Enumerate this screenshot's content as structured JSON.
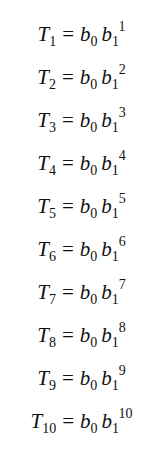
{
  "equations": [
    {
      "lhs_var": "T",
      "lhs_sub": "1",
      "op": "=",
      "a": "b",
      "a_sub": "0",
      "b": "b",
      "b_sub": "1",
      "b_sup": "1"
    },
    {
      "lhs_var": "T",
      "lhs_sub": "2",
      "op": "=",
      "a": "b",
      "a_sub": "0",
      "b": "b",
      "b_sub": "1",
      "b_sup": "2"
    },
    {
      "lhs_var": "T",
      "lhs_sub": "3",
      "op": "=",
      "a": "b",
      "a_sub": "0",
      "b": "b",
      "b_sub": "1",
      "b_sup": "3"
    },
    {
      "lhs_var": "T",
      "lhs_sub": "4",
      "op": "=",
      "a": "b",
      "a_sub": "0",
      "b": "b",
      "b_sub": "1",
      "b_sup": "4"
    },
    {
      "lhs_var": "T",
      "lhs_sub": "5",
      "op": "=",
      "a": "b",
      "a_sub": "0",
      "b": "b",
      "b_sub": "1",
      "b_sup": "5"
    },
    {
      "lhs_var": "T",
      "lhs_sub": "6",
      "op": "=",
      "a": "b",
      "a_sub": "0",
      "b": "b",
      "b_sub": "1",
      "b_sup": "6"
    },
    {
      "lhs_var": "T",
      "lhs_sub": "7",
      "op": "=",
      "a": "b",
      "a_sub": "0",
      "b": "b",
      "b_sub": "1",
      "b_sup": "7"
    },
    {
      "lhs_var": "T",
      "lhs_sub": "8",
      "op": "=",
      "a": "b",
      "a_sub": "0",
      "b": "b",
      "b_sub": "1",
      "b_sup": "8"
    },
    {
      "lhs_var": "T",
      "lhs_sub": "9",
      "op": "=",
      "a": "b",
      "a_sub": "0",
      "b": "b",
      "b_sub": "1",
      "b_sup": "9"
    },
    {
      "lhs_var": "T",
      "lhs_sub": "10",
      "op": "=",
      "a": "b",
      "a_sub": "0",
      "b": "b",
      "b_sub": "1",
      "b_sup": "10"
    }
  ]
}
